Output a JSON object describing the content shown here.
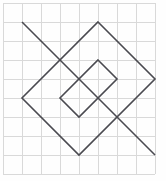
{
  "figure": {
    "canvas": {
      "width": 166,
      "height": 181,
      "background": "#fefefe"
    },
    "colors": {
      "grid": "#d9d9d9",
      "stroke": "#4a4a50",
      "background": "#fefefe"
    },
    "grid": {
      "visible": true,
      "spacing": 19,
      "origin_x": 3,
      "origin_y": 3,
      "columns": 8,
      "rows": 9,
      "x_positions": [
        3,
        22,
        41,
        60,
        79,
        98,
        117,
        136,
        155
      ],
      "y_positions": [
        3,
        22,
        41,
        60,
        79,
        98,
        117,
        136,
        155,
        174
      ]
    },
    "shapes": [
      {
        "name": "large-diamond",
        "type": "polygon",
        "closed": true,
        "points": [
          [
            98,
            22
          ],
          [
            155,
            79
          ],
          [
            79,
            155
          ],
          [
            22,
            98
          ]
        ],
        "stroke": "#4a4a50",
        "stroke_width": 1.6
      },
      {
        "name": "small-diamond",
        "type": "polygon",
        "closed": true,
        "points": [
          [
            98,
            60
          ],
          [
            117,
            79
          ],
          [
            79,
            117
          ],
          [
            60,
            98
          ]
        ],
        "stroke": "#4a4a50",
        "stroke_width": 1.6
      },
      {
        "name": "diagonal-line",
        "type": "polyline",
        "closed": false,
        "points": [
          [
            22,
            22
          ],
          [
            155,
            155
          ]
        ],
        "stroke": "#4a4a50",
        "stroke_width": 1.6
      }
    ]
  }
}
